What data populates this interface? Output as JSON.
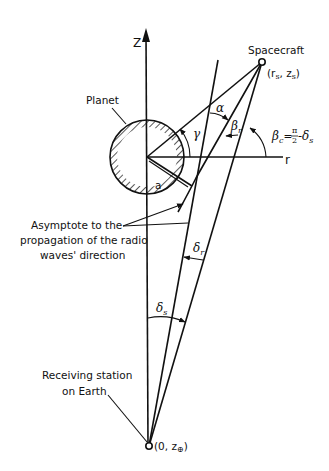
{
  "diagram": {
    "axes": {
      "z_label": "Z",
      "r_label": "r"
    },
    "labels": {
      "spacecraft": "Spacecraft",
      "spacecraft_coord": "(r",
      "spacecraft_coord_s1": "s",
      "spacecraft_coord_mid": ", z",
      "spacecraft_coord_s2": "s",
      "spacecraft_coord_end": ")",
      "planet": "Planet",
      "radius": "a",
      "asymptote_line1": "Asymptote to the",
      "asymptote_line2": "propagation of the radio",
      "asymptote_line3": "waves' direction",
      "station_line1": "Receiving station",
      "station_line2": "on Earth",
      "station_coord": "(0, z",
      "station_coord_sub": "⊕",
      "station_coord_end": ")"
    },
    "angles": {
      "alpha": "α",
      "gamma": "γ",
      "beta_r": "β",
      "beta_r_sub": "r",
      "beta_c": "β",
      "beta_c_sub": "c",
      "beta_c_eq": "=",
      "beta_c_pi": "π",
      "beta_c_two": "2",
      "beta_c_minus": "-δ",
      "beta_c_minus_sub": "s",
      "delta_r": "δ",
      "delta_r_sub": "r",
      "delta_s": "δ",
      "delta_s_sub": "s"
    }
  }
}
